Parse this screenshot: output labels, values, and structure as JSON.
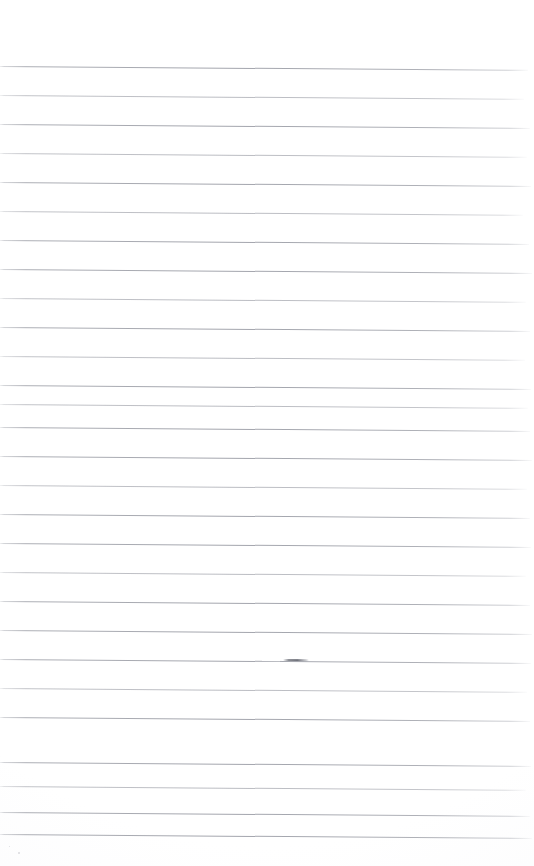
{
  "document": {
    "kind": "scanned-lined-notebook-page",
    "title": "Blank Lined Notebook Page",
    "page_width": 534,
    "page_height": 866,
    "background_color": "#ffffff",
    "rule_color": "#a8aab1",
    "written_content": "",
    "has_text": false,
    "has_margin_rule": false,
    "has_holes": false
  },
  "ruling": {
    "line_count": 27,
    "line_spacing_px": 29.2,
    "first_line_y": 66,
    "last_line_y": 834,
    "line_thickness_px": 1,
    "left_inset_px": 0,
    "right_end_px": 528,
    "skew_degrees": 0.42,
    "skew_note": "lines slant slightly downward from left to right (scan skew)",
    "lines": [
      {
        "index": 1,
        "y": 66,
        "weight": "strong",
        "width": 528
      },
      {
        "index": 2,
        "y": 95,
        "weight": "faint",
        "width": 524
      },
      {
        "index": 3,
        "y": 124,
        "weight": "strong",
        "width": 530
      },
      {
        "index": 4,
        "y": 153,
        "weight": "faint",
        "width": 527
      },
      {
        "index": 5,
        "y": 182,
        "weight": "strong",
        "width": 531
      },
      {
        "index": 6,
        "y": 211,
        "weight": "faint",
        "width": 523
      },
      {
        "index": 7,
        "y": 240,
        "weight": "strong",
        "width": 529
      },
      {
        "index": 8,
        "y": 269,
        "weight": "strong",
        "width": 532
      },
      {
        "index": 9,
        "y": 298,
        "weight": "faint",
        "width": 526
      },
      {
        "index": 10,
        "y": 327,
        "weight": "strong",
        "width": 530
      },
      {
        "index": 11,
        "y": 356,
        "weight": "faint",
        "width": 525
      },
      {
        "index": 12,
        "y": 385,
        "weight": "strong",
        "width": 531
      },
      {
        "index": 13,
        "y": 404,
        "weight": "faint",
        "width": 528
      },
      {
        "index": 14,
        "y": 427,
        "weight": "strong",
        "width": 530
      },
      {
        "index": 15,
        "y": 456,
        "weight": "strong",
        "width": 532
      },
      {
        "index": 16,
        "y": 485,
        "weight": "faint",
        "width": 527
      },
      {
        "index": 17,
        "y": 514,
        "weight": "strong",
        "width": 530
      },
      {
        "index": 18,
        "y": 543,
        "weight": "strong",
        "width": 531
      },
      {
        "index": 19,
        "y": 572,
        "weight": "faint",
        "width": 526
      },
      {
        "index": 20,
        "y": 601,
        "weight": "strong",
        "width": 530
      },
      {
        "index": 21,
        "y": 630,
        "weight": "strong",
        "width": 532
      },
      {
        "index": 22,
        "y": 659,
        "weight": "strong",
        "width": 531
      },
      {
        "index": 23,
        "y": 688,
        "weight": "faint",
        "width": 527
      },
      {
        "index": 24,
        "y": 717,
        "weight": "strong",
        "width": 530
      },
      {
        "index": 25,
        "y": 762,
        "weight": "strong",
        "width": 531
      },
      {
        "index": 26,
        "y": 786,
        "weight": "faint",
        "width": 526
      },
      {
        "index": 27,
        "y": 812,
        "weight": "strong",
        "width": 530
      },
      {
        "index": 28,
        "y": 834,
        "weight": "strong",
        "width": 532
      }
    ]
  },
  "marks": [
    {
      "name": "pen-dash",
      "description": "short darker horizontal dash resting on a ruled line",
      "x": 283,
      "y": 659,
      "width": 26,
      "color": "#6a6c74"
    },
    {
      "name": "pen-gap",
      "description": "small lightened break in the rule just left of the dash",
      "x": 262,
      "y": 658,
      "width": 18
    }
  ],
  "specks": [
    {
      "x": 18,
      "y": 852,
      "size": 2
    },
    {
      "x": 9,
      "y": 846,
      "size": 1
    }
  ]
}
